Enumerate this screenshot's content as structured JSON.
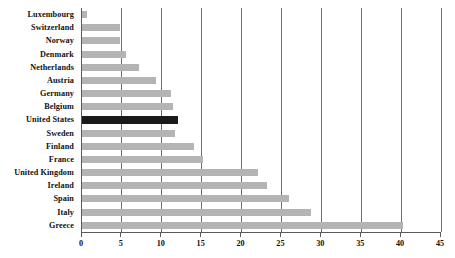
{
  "chart_data": {
    "type": "bar",
    "orientation": "horizontal",
    "title": "",
    "subtitle": "",
    "xlabel": "",
    "ylabel": "",
    "xlim": [
      0,
      45
    ],
    "xticks": [
      0,
      5,
      10,
      15,
      20,
      25,
      30,
      35,
      40,
      45
    ],
    "grid": true,
    "grid_axis": "x",
    "legend": false,
    "categories": [
      "Luxembourg",
      "Switzerland",
      "Norway",
      "Denmark",
      "Netherlands",
      "Austria",
      "Germany",
      "Belgium",
      "United States",
      "Sweden",
      "Finland",
      "France",
      "United Kingdom",
      "Ireland",
      "Spain",
      "Italy",
      "Greece"
    ],
    "values": [
      0.6,
      4.8,
      4.8,
      5.5,
      7.2,
      9.3,
      11.2,
      11.4,
      12.0,
      11.7,
      14.0,
      15.2,
      22.0,
      23.2,
      26.0,
      28.7,
      40.2
    ],
    "highlight_category": "United States",
    "colors": {
      "bar": "#b4b4b4",
      "highlight_bar": "#1a1a1a",
      "gridline": "#6e6e6e",
      "axis": "#5a5a5a",
      "text": "#111111",
      "background": "#ffffff"
    }
  }
}
